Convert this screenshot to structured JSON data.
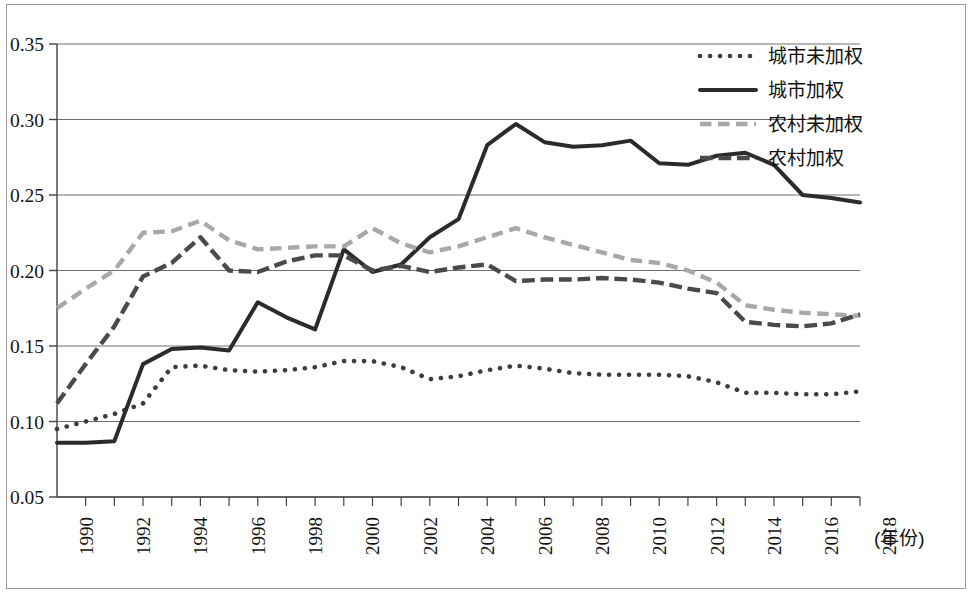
{
  "figure": {
    "background_color": "#ffffff",
    "border_color": "#9a9a9a"
  },
  "axes": {
    "y_ticks": [
      "0.05",
      "0.10",
      "0.15",
      "0.20",
      "0.25",
      "0.30",
      "0.35"
    ],
    "x_ticks": [
      "1990",
      "1992",
      "1994",
      "1996",
      "1998",
      "2000",
      "2002",
      "2004",
      "2006",
      "2008",
      "2010",
      "2012",
      "2014",
      "2016",
      "2018"
    ],
    "x_unit_label": "(年份)",
    "gridline_color": "#6e6e6e",
    "axis_color": "#444444"
  },
  "legend": {
    "position": "top-right",
    "items": [
      {
        "label": "城市未加权",
        "style": "dotted",
        "color": "#3d3d3d"
      },
      {
        "label": "城市加权",
        "style": "solid",
        "color": "#2b2b2b"
      },
      {
        "label": "农村未加权",
        "style": "dashed",
        "color": "#a8a8a8"
      },
      {
        "label": "农村加权",
        "style": "dash-dot",
        "color": "#4a4a4a"
      }
    ]
  },
  "chart_data": {
    "type": "line",
    "title": "",
    "xlabel": "(年份)",
    "ylabel": "",
    "xlim": [
      1989,
      2017
    ],
    "ylim": [
      0.05,
      0.35
    ],
    "ytick_step": 0.05,
    "grid": true,
    "legend_position": "top-right",
    "x": [
      1989,
      1990,
      1991,
      1992,
      1993,
      1994,
      1995,
      1996,
      1997,
      1998,
      1999,
      2000,
      2001,
      2002,
      2003,
      2004,
      2005,
      2006,
      2007,
      2008,
      2009,
      2010,
      2011,
      2012,
      2013,
      2014,
      2015,
      2016,
      2017
    ],
    "series": [
      {
        "name": "城市未加权",
        "style": "dotted",
        "color": "#3d3d3d",
        "values": [
          0.095,
          0.1,
          0.105,
          0.112,
          0.136,
          0.137,
          0.134,
          0.133,
          0.134,
          0.136,
          0.14,
          0.14,
          0.136,
          0.128,
          0.13,
          0.134,
          0.137,
          0.135,
          0.132,
          0.131,
          0.131,
          0.131,
          0.13,
          0.126,
          0.119,
          0.119,
          0.118,
          0.118,
          0.12
        ]
      },
      {
        "name": "城市加权",
        "style": "solid",
        "color": "#2b2b2b",
        "values": [
          0.086,
          0.086,
          0.087,
          0.138,
          0.148,
          0.149,
          0.147,
          0.179,
          0.169,
          0.161,
          0.214,
          0.199,
          0.204,
          0.222,
          0.234,
          0.283,
          0.297,
          0.285,
          0.282,
          0.283,
          0.286,
          0.271,
          0.27,
          0.276,
          0.278,
          0.27,
          0.25,
          0.248,
          0.245
        ]
      },
      {
        "name": "农村未加权",
        "style": "dashed",
        "color": "#a8a8a8",
        "values": [
          0.175,
          0.188,
          0.2,
          0.225,
          0.226,
          0.233,
          0.22,
          0.214,
          0.215,
          0.216,
          0.216,
          0.228,
          0.218,
          0.212,
          0.216,
          0.222,
          0.228,
          0.222,
          0.217,
          0.212,
          0.207,
          0.205,
          0.2,
          0.192,
          0.177,
          0.174,
          0.172,
          0.171,
          0.17
        ]
      },
      {
        "name": "农村加权",
        "style": "dash-dot",
        "color": "#4a4a4a",
        "values": [
          0.112,
          0.138,
          0.163,
          0.196,
          0.205,
          0.222,
          0.2,
          0.199,
          0.206,
          0.21,
          0.21,
          0.2,
          0.203,
          0.199,
          0.202,
          0.204,
          0.193,
          0.194,
          0.194,
          0.195,
          0.194,
          0.192,
          0.188,
          0.185,
          0.166,
          0.164,
          0.163,
          0.165,
          0.171
        ]
      }
    ]
  }
}
